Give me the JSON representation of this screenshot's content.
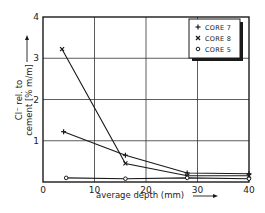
{
  "chart_data": {
    "type": "line",
    "title": "",
    "xlabel": "average depth (mm)",
    "ylabel_line1": "Cl⁻ rel. to",
    "ylabel_line2": "cement [% m/m]",
    "xlim": [
      0,
      40
    ],
    "ylim": [
      0,
      4
    ],
    "xticks": [
      0,
      10,
      20,
      30,
      40
    ],
    "yticks": [
      1,
      2,
      3,
      4
    ],
    "grid": true,
    "legend_position": "upper right",
    "series": [
      {
        "name": "CORE 7",
        "marker": "+",
        "x": [
          4,
          16,
          28,
          40
        ],
        "y": [
          1.22,
          0.65,
          0.22,
          0.2
        ]
      },
      {
        "name": "CORE 8",
        "marker": "x",
        "x": [
          3.7,
          16,
          28,
          40
        ],
        "y": [
          3.22,
          0.45,
          0.15,
          0.15
        ]
      },
      {
        "name": "CORE 5",
        "marker": "o",
        "x": [
          4.5,
          16,
          28,
          40
        ],
        "y": [
          0.1,
          0.08,
          0.1,
          0.08
        ]
      }
    ]
  },
  "axes": {
    "x_label": "average depth (mm)",
    "y_label_line1": "Cl⁻ rel. to",
    "y_label_line2": "cement [% m/m]",
    "x_tick_labels": [
      "0",
      "10",
      "20",
      "30",
      "40"
    ],
    "y_tick_labels": [
      "1",
      "2",
      "3",
      "4"
    ]
  },
  "legend": {
    "items": [
      {
        "symbol": "+",
        "label": "CORE 7"
      },
      {
        "symbol": "×",
        "label": "CORE 8"
      },
      {
        "symbol": "o",
        "label": "CORE 5"
      }
    ]
  },
  "colors": {
    "ink": "#1a1a1a",
    "grid": "#333333",
    "background": "#ffffff"
  }
}
